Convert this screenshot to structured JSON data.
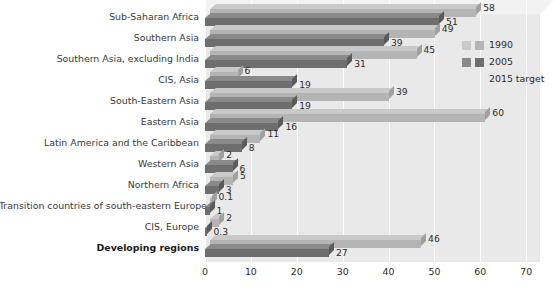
{
  "chart_data": {
    "type": "bar",
    "orientation": "horizontal",
    "title": "",
    "subtitle": "",
    "xlabel": "",
    "ylabel": "",
    "xlim": [
      0,
      70
    ],
    "xticks": [
      0,
      10,
      20,
      30,
      40,
      50,
      60,
      70
    ],
    "xtick_labels": [
      "0",
      "10",
      "20",
      "30",
      "40",
      "50",
      "60",
      "70"
    ],
    "grid": true,
    "grid_axis": "x",
    "legend_position": "right",
    "categories": [
      "Sub-Saharan Africa",
      "Southern Asia",
      "Southern Asia, excluding India",
      "CIS, Asia",
      "South-Eastern Asia",
      "Eastern Asia",
      "Latin America and the Caribbean",
      "Western Asia",
      "Northern Africa",
      "Transition countries of south-eastern Europe",
      "CIS, Europe",
      "Developing regions"
    ],
    "series": [
      {
        "name": "1990",
        "color": "#b4b4b4",
        "values": [
          58,
          49,
          45,
          6,
          39,
          60,
          11,
          2,
          5,
          0.1,
          2,
          46
        ],
        "value_labels": [
          "58",
          "49",
          "45",
          "6",
          "39",
          "60",
          "11",
          "2",
          "5",
          "0.1",
          "2",
          "46"
        ]
      },
      {
        "name": "2005",
        "color": "#6e6e6e",
        "values": [
          51,
          39,
          31,
          19,
          19,
          16,
          8,
          6,
          3,
          1,
          0.3,
          27
        ],
        "value_labels": [
          "51",
          "39",
          "31",
          "19",
          "19",
          "16",
          "8",
          "6",
          "3",
          "1",
          "0.3",
          "27"
        ]
      }
    ],
    "legend_entries": [
      "1990",
      "2005",
      "2015 target"
    ],
    "bold_categories": [
      "Developing regions"
    ]
  },
  "legend": {
    "items": [
      {
        "label": "1990",
        "swatch_a": "#c9c9c9",
        "swatch_b": "#b4b4b4",
        "has_swatch": true
      },
      {
        "label": "2005",
        "swatch_a": "#8a8a8a",
        "swatch_b": "#6e6e6e",
        "has_swatch": true
      },
      {
        "label": "2015 target",
        "swatch_a": "#f1f1f1",
        "swatch_b": "#f1f1f1",
        "has_swatch": false
      }
    ]
  },
  "colors": {
    "plot_background": "#e9e9e9",
    "gridline": "#ffffff",
    "series_1990": "#b4b4b4",
    "series_2005": "#6e6e6e",
    "series_target": "#f1f1f1",
    "text": "#2b2b2b"
  }
}
